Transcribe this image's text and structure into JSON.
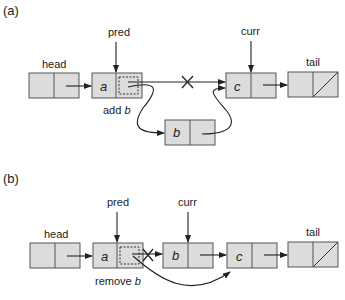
{
  "panels": [
    {
      "id": "a",
      "label": "(a)",
      "pointers": {
        "pred": "pred",
        "curr": "curr"
      },
      "nodes": {
        "head": "head",
        "tail": "tail",
        "a": "a",
        "b": "b",
        "c": "c"
      },
      "operation": {
        "verb": "add",
        "target": "b"
      }
    },
    {
      "id": "b",
      "label": "(b)",
      "pointers": {
        "pred": "pred",
        "curr": "curr"
      },
      "nodes": {
        "head": "head",
        "tail": "tail",
        "a": "a",
        "b": "b",
        "c": "c"
      },
      "operation": {
        "verb": "remove",
        "target": "b"
      }
    }
  ],
  "colors": {
    "node_fill": "#dcdcdc",
    "node_stroke": "#555555",
    "line": "#222222"
  }
}
